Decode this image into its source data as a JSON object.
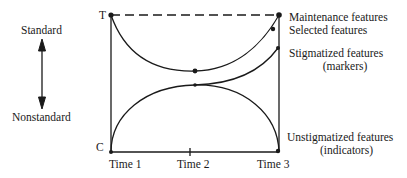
{
  "scale": {
    "top_label": "Standard",
    "bottom_label": "Nonstandard",
    "arrow_icon": "double-headed-vertical-arrow"
  },
  "axis": {
    "top_marker": "T",
    "bottom_marker": "C",
    "time_labels": [
      "Time 1",
      "Time 2",
      "Time 3"
    ]
  },
  "curves": {
    "maintenance": "Maintenance features",
    "selected": "Selected features",
    "stigmatized": "Stigmatized features",
    "stigmatized_sub": "(markers)",
    "unstigmatized": "Unstigmatized features",
    "unstigmatized_sub": "(indicators)"
  },
  "colors": {
    "ink": "#1a1a1a",
    "background": "#ffffff"
  }
}
